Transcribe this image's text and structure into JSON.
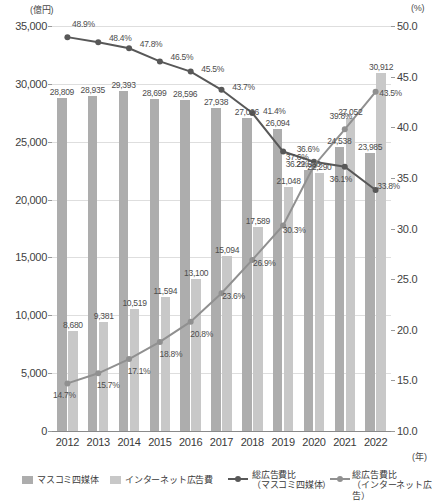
{
  "axes": {
    "left_unit": "(億円)",
    "right_unit": "(%)",
    "year_unit": "(年)",
    "left_ticks": [
      "35,000",
      "30,000",
      "25,000",
      "20,000",
      "15,000",
      "10,000",
      "5,000",
      "0"
    ],
    "right_ticks": [
      "50.0",
      "45.0",
      "40.0",
      "35.0",
      "30.0",
      "25.0",
      "20.0",
      "15.0",
      "10.0"
    ]
  },
  "legend": {
    "mass_bar": "マスコミ四媒体",
    "net_bar": "インターネット広告費",
    "mass_line_l1": "総広告費比",
    "mass_line_l2": "（マスコミ四媒体）",
    "net_line_l1": "総広告費比",
    "net_line_l2": "（インターネット広告）"
  },
  "chart_data": {
    "type": "bar",
    "title": "",
    "xlabel": "(年)",
    "ylabel": "(億円)",
    "y2label": "(%)",
    "ylim": [
      0,
      35000
    ],
    "y2lim": [
      10.0,
      50.0
    ],
    "grid": true,
    "legend_position": "bottom",
    "categories": [
      "2012",
      "2013",
      "2014",
      "2015",
      "2016",
      "2017",
      "2018",
      "2019",
      "2020",
      "2021",
      "2022"
    ],
    "series": [
      {
        "name": "マスコミ四媒体",
        "type": "bar",
        "axis": "left",
        "color": "#adadad",
        "values": [
          28809,
          28935,
          29393,
          28699,
          28596,
          27938,
          27026,
          26094,
          22536,
          24538,
          23985
        ],
        "labels": [
          "28,809",
          "28,935",
          "29,393",
          "28,699",
          "28,596",
          "27,938",
          "27,026",
          "26,094",
          "22,536",
          "24,538",
          "23,985"
        ]
      },
      {
        "name": "インターネット広告費",
        "type": "bar",
        "axis": "left",
        "color": "#c8c8c8",
        "values": [
          8680,
          9381,
          10519,
          11594,
          13100,
          15094,
          17589,
          21048,
          22290,
          27052,
          30912
        ],
        "labels": [
          "8,680",
          "9,381",
          "10,519",
          "11,594",
          "13,100",
          "15,094",
          "17,589",
          "21,048",
          "22,290",
          "27,052",
          "30,912"
        ]
      },
      {
        "name": "総広告費比（マスコミ四媒体）",
        "type": "line",
        "axis": "right",
        "color": "#585858",
        "values": [
          48.9,
          48.4,
          47.8,
          46.5,
          45.5,
          43.7,
          41.4,
          37.6,
          36.6,
          36.1,
          33.8
        ],
        "labels": [
          "48.9%",
          "48.4%",
          "47.8%",
          "46.5%",
          "45.5%",
          "43.7%",
          "41.4%",
          "37.6%",
          "36.6%",
          "36.1%",
          "33.8%"
        ]
      },
      {
        "name": "総広告費比（インターネット広告）",
        "type": "line",
        "axis": "right",
        "color": "#909090",
        "values": [
          14.7,
          15.7,
          17.1,
          18.8,
          20.8,
          23.6,
          26.9,
          30.3,
          36.2,
          39.8,
          43.5
        ],
        "labels": [
          "14.7%",
          "15.7%",
          "17.1%",
          "18.8%",
          "20.8%",
          "23.6%",
          "26.9%",
          "30.3%",
          "36.2%",
          "39.8%",
          "43.5%"
        ]
      }
    ]
  }
}
